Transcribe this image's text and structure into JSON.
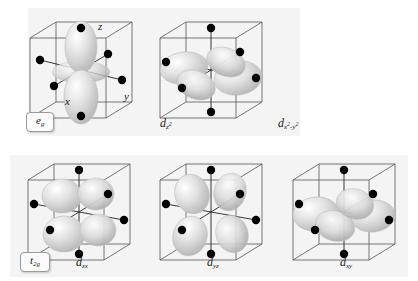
{
  "figure": {
    "background_color": "#ffffff",
    "panel_color": "#f4f4f4",
    "lobe_color": "#d8d8d8",
    "ligand_color": "#000000",
    "cube_edge_color": "#555555"
  },
  "sets": [
    {
      "id": "eg",
      "badge_label": "e",
      "badge_sub": "g",
      "orbital_count": 2
    },
    {
      "id": "t2g",
      "badge_label": "t",
      "badge_sub": "2g",
      "orbital_count": 3
    }
  ],
  "axes": {
    "z": "z",
    "x": "x",
    "y": "y"
  },
  "orbitals": [
    {
      "id": "dz2",
      "set": "eg",
      "caption_main": "d",
      "caption_sub": "z",
      "caption_sup": "2",
      "caption_plain": "dz2",
      "shape": "two-lobes-along-z-with-torus",
      "ligands": 6
    },
    {
      "id": "dx2y2",
      "set": "eg",
      "caption_main": "d",
      "caption_sub": "x",
      "caption_sup": "2",
      "caption_sub2": "-y",
      "caption_sup2": "2",
      "caption_plain": "dx2-y2",
      "shape": "four-lobes-along-x-and-y",
      "ligands": 6
    },
    {
      "id": "dzx",
      "set": "t2g",
      "caption_main": "d",
      "caption_sub": "zx",
      "caption_plain": "dzx",
      "shape": "four-lobes-between-z-and-x",
      "ligands": 6
    },
    {
      "id": "dyz",
      "set": "t2g",
      "caption_main": "d",
      "caption_sub": "yz",
      "caption_plain": "dyz",
      "shape": "four-lobes-between-y-and-z",
      "ligands": 6
    },
    {
      "id": "dxy",
      "set": "t2g",
      "caption_main": "d",
      "caption_sub": "xy",
      "caption_plain": "dxy",
      "shape": "four-lobes-between-x-and-y",
      "ligands": 6
    }
  ]
}
